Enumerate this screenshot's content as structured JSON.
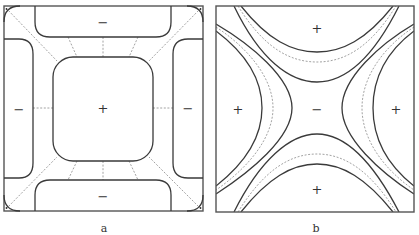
{
  "figure": {
    "panels": [
      {
        "id": "a",
        "caption": "a",
        "regions": [
          {
            "name": "center",
            "sign": "+"
          },
          {
            "name": "top",
            "sign": "−"
          },
          {
            "name": "bottom",
            "sign": "−"
          },
          {
            "name": "left",
            "sign": "−"
          },
          {
            "name": "right",
            "sign": "−"
          }
        ],
        "description": "Square domain with a rounded central positive region surrounded by four negative rounded bands along the edges; dashed lines radiate from the central region to the edges and corners."
      },
      {
        "id": "b",
        "caption": "b",
        "regions": [
          {
            "name": "center",
            "sign": "−"
          },
          {
            "name": "top",
            "sign": "+"
          },
          {
            "name": "bottom",
            "sign": "+"
          },
          {
            "name": "left",
            "sign": "+"
          },
          {
            "name": "right",
            "sign": "+"
          }
        ],
        "description": "Square domain with a saddle-shaped negative central region bounded by four hyperbola-like curves; four positive lobes at top, bottom, left and right with dashed curves between paired solid curves."
      }
    ]
  }
}
